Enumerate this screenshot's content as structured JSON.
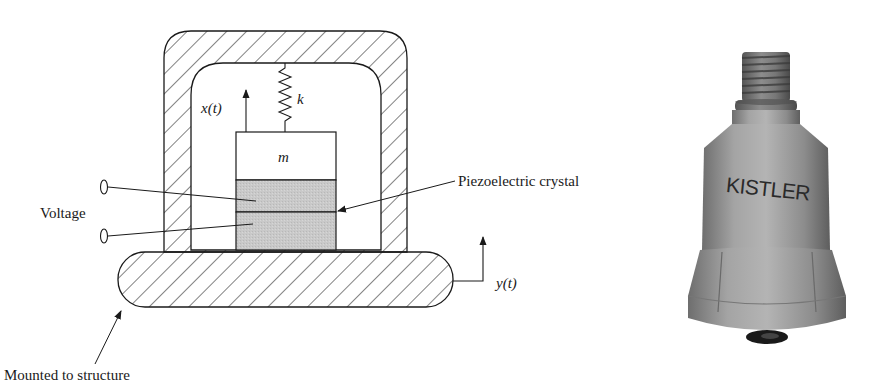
{
  "figure": {
    "diagram": {
      "labels": {
        "displacement_mass": "x(t)",
        "spring_constant": "k",
        "mass": "m",
        "voltage": "Voltage",
        "crystal": "Piezoelectric crystal",
        "displacement_base": "y(t)",
        "mount": "Mounted to structure"
      },
      "colors": {
        "line": "#1a1a1a",
        "crystal_fill": "#c8c8c8",
        "background": "#ffffff"
      }
    },
    "photo": {
      "brand_text": "KISTLER",
      "colors": {
        "body": "#9a9a9a",
        "shadow": "#6e6e6e",
        "highlight": "#bdbdbd"
      }
    }
  }
}
